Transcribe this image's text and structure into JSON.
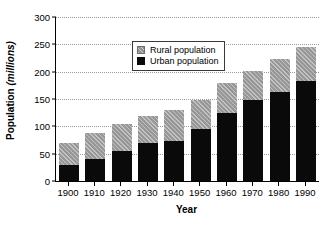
{
  "chart_data": {
    "type": "bar",
    "stacked": true,
    "title": "",
    "xlabel": "Year",
    "ylabel_prefix": "Population ",
    "ylabel_unit": "(millions)",
    "categories": [
      "1900",
      "1910",
      "1920",
      "1930",
      "1940",
      "1950",
      "1960",
      "1970",
      "1980",
      "1990"
    ],
    "series": [
      {
        "name": "Urban population",
        "color": "#0a0a0a",
        "values": [
          29,
          40,
          55,
          69,
          73,
          95,
          124,
          148,
          163,
          183
        ]
      },
      {
        "name": "Rural population",
        "color": "#a8a8a8",
        "values": [
          40,
          48,
          49,
          50,
          57,
          53,
          55,
          53,
          60,
          63
        ]
      }
    ],
    "totals": [
      69,
      88,
      104,
      119,
      130,
      148,
      179,
      201,
      223,
      246
    ],
    "ylim": [
      0,
      300
    ],
    "yticks": [
      0,
      50,
      100,
      150,
      200,
      250,
      300
    ],
    "ytick_labels": [
      "0",
      "50",
      "100",
      "150",
      "200",
      "250",
      "300"
    ],
    "grid": "horizontal-dotted",
    "legend_position": "upper-left-inside",
    "legend_entries": [
      {
        "label": "Rural population",
        "swatch": "rural"
      },
      {
        "label": "Urban population",
        "swatch": "urban"
      }
    ]
  }
}
